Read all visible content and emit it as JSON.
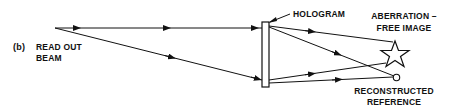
{
  "figure": {
    "panel_label": "(b)",
    "source_label_line1": "READ OUT",
    "source_label_line2": "BEAM",
    "hologram_label": "HOLOGRAM",
    "image_label_line1": "ABERRATION –",
    "image_label_line2": "FREE IMAGE",
    "reference_label_line1": "RECONSTRUCTED",
    "reference_label_line2": "REFERENCE"
  },
  "colors": {
    "ink": "#111111",
    "background": "#ffffff"
  }
}
